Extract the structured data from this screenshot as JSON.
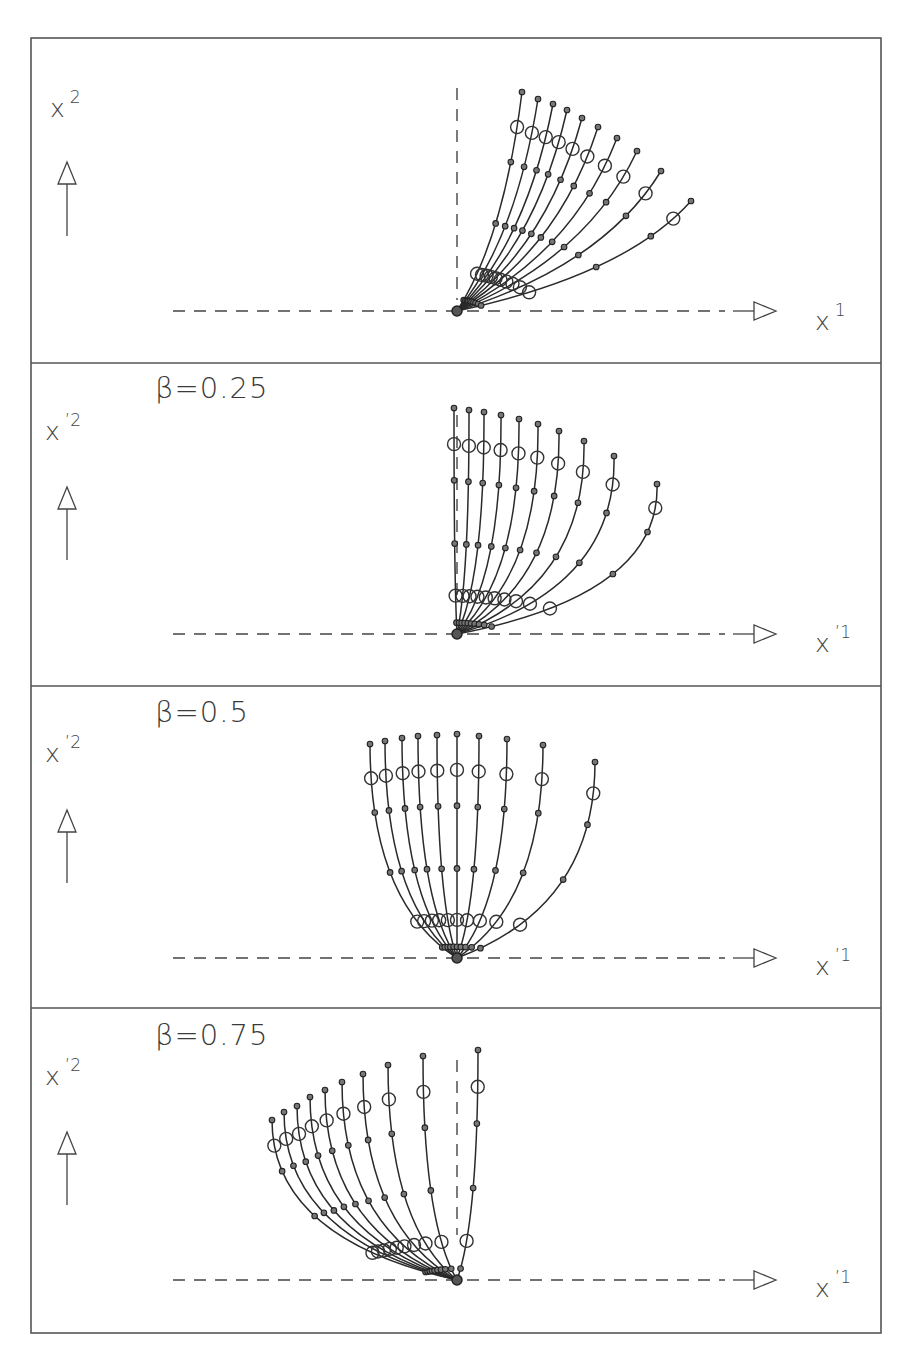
{
  "figure": {
    "frame": {
      "x": 31,
      "y": 38,
      "width": 850,
      "height": 1295,
      "separators": [
        363,
        686,
        1008
      ]
    },
    "marker_fractions": [
      0.05,
      0.17,
      0.4,
      0.68,
      0.84,
      1.0
    ],
    "big_marker_indices": [
      1,
      4
    ],
    "panels": [
      {
        "id": "panel-1",
        "beta_label": "",
        "y_axis_label": "x",
        "y_axis_sup": "2",
        "x_axis_label": "x",
        "x_axis_sup": "1",
        "origin": [
          457,
          311
        ],
        "y_label_pos": [
          50,
          117
        ],
        "y_arrow": {
          "x": 67,
          "tip": 162,
          "base": 236
        },
        "h_axis": {
          "dash_from": 173,
          "dash_to": 745,
          "arrow_tip": 776
        },
        "x_label_pos": [
          815,
          330
        ],
        "beta_pos": [
          155,
          95
        ],
        "v_axis": {
          "from": 88,
          "to": 300
        },
        "bend": {
          "kx": 0.72,
          "ky": 0.33
        },
        "curve_ends": [
          [
            522,
            92
          ],
          [
            538,
            99
          ],
          [
            553,
            104
          ],
          [
            567,
            110
          ],
          [
            582,
            118
          ],
          [
            598,
            127
          ],
          [
            617,
            138
          ],
          [
            637,
            151
          ],
          [
            661,
            171
          ],
          [
            691,
            201
          ]
        ]
      },
      {
        "id": "panel-2",
        "beta_label": "β=0.25",
        "y_axis_label": "x",
        "y_axis_sup": "’2",
        "x_axis_label": "x",
        "x_axis_sup": "’1",
        "origin": [
          457,
          634
        ],
        "y_label_pos": [
          45,
          440
        ],
        "y_arrow": {
          "x": 67,
          "tip": 487,
          "base": 560
        },
        "h_axis": {
          "dash_from": 173,
          "dash_to": 745,
          "arrow_tip": 776
        },
        "x_label_pos": [
          815,
          652
        ],
        "beta_pos": [
          155,
          398
        ],
        "v_axis": {
          "from": 415,
          "to": 600
        },
        "bend": {
          "kx": 1.02,
          "ky": 0.26
        },
        "curve_ends": [
          [
            454,
            408
          ],
          [
            469,
            410
          ],
          [
            484,
            412
          ],
          [
            501,
            415
          ],
          [
            519,
            419
          ],
          [
            538,
            424
          ],
          [
            559,
            431
          ],
          [
            584,
            441
          ],
          [
            614,
            456
          ],
          [
            657,
            484
          ]
        ]
      },
      {
        "id": "panel-3",
        "beta_label": "β=0.5",
        "y_axis_label": "x",
        "y_axis_sup": "’2",
        "x_axis_label": "x",
        "x_axis_sup": "’1",
        "origin": [
          457,
          958
        ],
        "y_label_pos": [
          45,
          762
        ],
        "y_arrow": {
          "x": 67,
          "tip": 810,
          "base": 883
        },
        "h_axis": {
          "dash_from": 173,
          "dash_to": 745,
          "arrow_tip": 776
        },
        "x_label_pos": [
          815,
          975
        ],
        "beta_pos": [
          155,
          722
        ],
        "v_axis": null,
        "bend": {
          "kx": 1.0,
          "ky": 0.26
        },
        "curve_ends": [
          [
            370,
            744
          ],
          [
            385,
            741
          ],
          [
            402,
            738
          ],
          [
            418,
            736
          ],
          [
            437,
            735
          ],
          [
            457,
            734
          ],
          [
            479,
            736
          ],
          [
            507,
            739
          ],
          [
            543,
            745
          ],
          [
            595,
            762
          ]
        ]
      },
      {
        "id": "panel-4",
        "beta_label": "β=0.75",
        "y_axis_label": "x",
        "y_axis_sup": "’2",
        "x_axis_label": "x",
        "x_axis_sup": "’1",
        "origin": [
          457,
          1280
        ],
        "y_label_pos": [
          45,
          1085
        ],
        "y_arrow": {
          "x": 67,
          "tip": 1132,
          "base": 1205
        },
        "h_axis": {
          "dash_from": 173,
          "dash_to": 745,
          "arrow_tip": 776
        },
        "x_label_pos": [
          815,
          1297
        ],
        "beta_pos": [
          155,
          1045
        ],
        "v_axis": {
          "from": 1060,
          "to": 1235
        },
        "bend": {
          "kx": 1.0,
          "ky": 0.26
        },
        "curve_ends": [
          [
            272,
            1120
          ],
          [
            284,
            1112
          ],
          [
            297,
            1106
          ],
          [
            310,
            1097
          ],
          [
            325,
            1090
          ],
          [
            342,
            1082
          ],
          [
            363,
            1074
          ],
          [
            388,
            1065
          ],
          [
            423,
            1056
          ],
          [
            478,
            1050
          ]
        ]
      }
    ]
  }
}
